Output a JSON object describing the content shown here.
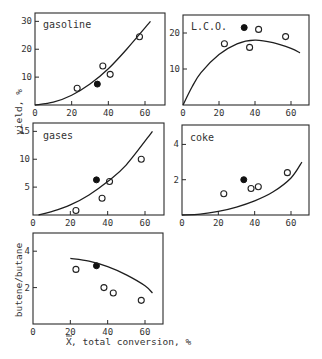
{
  "figure": {
    "ylabel_top": "yield, %",
    "ylabel_bottom": "butene/butane",
    "xlabel_prefix": "X",
    "xlabel": ", total conversion, %"
  },
  "chart_data": [
    {
      "type": "scatter",
      "title": "gasoline",
      "xlabel": "X, total conversion, %",
      "ylabel": "yield, %",
      "xlim": [
        0,
        70
      ],
      "ylim": [
        0,
        33
      ],
      "xticks": [
        0,
        20,
        40,
        60
      ],
      "yticks": [
        10,
        20,
        30
      ],
      "grid": false,
      "series": [
        {
          "name": "open",
          "marker": "open-circle",
          "x": [
            23,
            37,
            41,
            57
          ],
          "y": [
            6,
            14,
            11,
            24.5
          ]
        },
        {
          "name": "filled",
          "marker": "filled-circle",
          "x": [
            34
          ],
          "y": [
            7.5
          ]
        },
        {
          "name": "model",
          "marker": "line",
          "x": [
            0,
            10,
            20,
            30,
            40,
            50,
            63
          ],
          "y": [
            0,
            1,
            3.5,
            7.5,
            13,
            20,
            30
          ]
        }
      ]
    },
    {
      "type": "scatter",
      "title": "L.C.O.",
      "xlabel": "X, total conversion, %",
      "ylabel": "yield, %",
      "xlim": [
        0,
        70
      ],
      "ylim": [
        0,
        25
      ],
      "xticks": [
        0,
        20,
        40,
        60
      ],
      "yticks": [
        10,
        20
      ],
      "grid": false,
      "series": [
        {
          "name": "open",
          "marker": "open-circle",
          "x": [
            23,
            37,
            42,
            57
          ],
          "y": [
            17,
            16,
            21,
            19
          ]
        },
        {
          "name": "filled",
          "marker": "filled-circle",
          "x": [
            34
          ],
          "y": [
            21.5
          ]
        },
        {
          "name": "model",
          "marker": "line",
          "x": [
            0,
            5,
            10,
            20,
            30,
            40,
            50,
            60,
            65
          ],
          "y": [
            0,
            5,
            9,
            14,
            17,
            18,
            17.3,
            15.7,
            14.5
          ]
        }
      ]
    },
    {
      "type": "scatter",
      "title": "gases",
      "xlabel": "X, total conversion, %",
      "ylabel": "yield, %",
      "xlim": [
        0,
        70
      ],
      "ylim": [
        0,
        16.5
      ],
      "xticks": [
        0,
        20,
        40,
        60
      ],
      "yticks": [
        5,
        10,
        15
      ],
      "grid": false,
      "series": [
        {
          "name": "open",
          "marker": "open-circle",
          "x": [
            23,
            37,
            41,
            58
          ],
          "y": [
            0.8,
            3,
            6,
            10
          ]
        },
        {
          "name": "filled",
          "marker": "filled-circle",
          "x": [
            34
          ],
          "y": [
            6.3
          ]
        },
        {
          "name": "model",
          "marker": "line",
          "x": [
            3,
            10,
            20,
            30,
            40,
            50,
            64
          ],
          "y": [
            0,
            0.6,
            1.8,
            3.6,
            6,
            9,
            15
          ]
        }
      ]
    },
    {
      "type": "scatter",
      "title": "coke",
      "xlabel": "X, total conversion, %",
      "ylabel": "yield, %",
      "xlim": [
        0,
        70
      ],
      "ylim": [
        0,
        5.1
      ],
      "xticks": [
        0,
        20,
        40,
        60
      ],
      "yticks": [
        2,
        4
      ],
      "grid": false,
      "series": [
        {
          "name": "open",
          "marker": "open-circle",
          "x": [
            23,
            38,
            42,
            58
          ],
          "y": [
            1.2,
            1.5,
            1.6,
            2.4
          ]
        },
        {
          "name": "filled",
          "marker": "filled-circle",
          "x": [
            34
          ],
          "y": [
            2
          ]
        },
        {
          "name": "model",
          "marker": "line",
          "x": [
            0,
            10,
            20,
            30,
            40,
            50,
            60,
            66
          ],
          "y": [
            0,
            0.05,
            0.2,
            0.45,
            0.8,
            1.3,
            2.1,
            3
          ]
        }
      ]
    },
    {
      "type": "scatter",
      "title": "",
      "xlabel": "X, total conversion, %",
      "ylabel": "butene/butane",
      "xlim": [
        0,
        70
      ],
      "ylim": [
        0,
        5
      ],
      "xticks": [
        0,
        20,
        40,
        60
      ],
      "yticks": [
        2,
        4
      ],
      "grid": false,
      "series": [
        {
          "name": "open",
          "marker": "open-circle",
          "x": [
            23,
            38,
            43,
            58
          ],
          "y": [
            3,
            2,
            1.7,
            1.3
          ]
        },
        {
          "name": "filled",
          "marker": "filled-circle",
          "x": [
            34
          ],
          "y": [
            3.2
          ]
        },
        {
          "name": "model",
          "marker": "line",
          "x": [
            20,
            30,
            40,
            50,
            60,
            64
          ],
          "y": [
            3.6,
            3.45,
            3.15,
            2.7,
            2.1,
            1.7
          ]
        }
      ]
    }
  ]
}
